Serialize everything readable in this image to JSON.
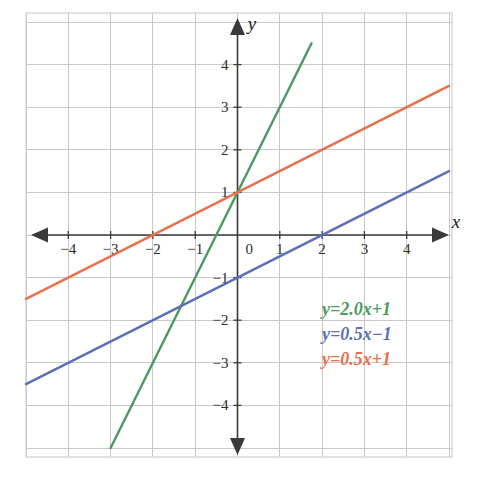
{
  "chart_data": {
    "type": "line",
    "title": "",
    "xlabel": "x",
    "ylabel": "y",
    "xlim": [
      -5,
      5
    ],
    "ylim": [
      -5,
      5
    ],
    "grid": true,
    "grid_step": 1,
    "legend_position": "inside-bottom-right",
    "x_tick_labels": [
      "-4",
      "-3",
      "-2",
      "-1",
      "0",
      "1",
      "2",
      "3",
      "4"
    ],
    "x_tick_values": [
      -4,
      -3,
      -2,
      -1,
      0,
      1,
      2,
      3,
      4
    ],
    "y_tick_labels": [
      "4",
      "3",
      "2",
      "1",
      "-1",
      "-2",
      "-3",
      "-4"
    ],
    "y_tick_values": [
      4,
      3,
      2,
      1,
      -1,
      -2,
      -3,
      -4
    ],
    "series": [
      {
        "name": "y=2.0x+1",
        "legend_label": "y=2.0x+1",
        "color": "#4a9a5e",
        "slope": 2.0,
        "intercept": 1,
        "x_start": -3.0,
        "x_end": 1.75,
        "y_start": -5.0,
        "y_end": 4.5,
        "x_intercept": -0.5,
        "y_intercept": 1
      },
      {
        "name": "y=0.5x-1",
        "legend_label": "y=0.5x−1",
        "color": "#5b6fb8",
        "slope": 0.5,
        "intercept": -1,
        "x_start": -5.0,
        "x_end": 5.0,
        "y_start": -3.5,
        "y_end": 1.5,
        "x_intercept": 2,
        "y_intercept": -1
      },
      {
        "name": "y=0.5x+1",
        "legend_label": "y=0.5x+1",
        "color": "#e8704a",
        "slope": 0.5,
        "intercept": 1,
        "x_start": -5.0,
        "x_end": 5.0,
        "y_start": -1.5,
        "y_end": 3.5,
        "x_intercept": -2,
        "y_intercept": 1
      }
    ],
    "annotations": []
  },
  "legend": {
    "items": [
      {
        "label": "y=2.0x+1",
        "color": "#4a9a5e"
      },
      {
        "label": "y=0.5x−1",
        "color": "#5b6fb8"
      },
      {
        "label": "y=0.5x+1",
        "color": "#e8704a"
      }
    ]
  },
  "axes": {
    "x_axis_label": "x",
    "y_axis_label": "y",
    "axis_color": "#3a3a3a",
    "grid_color": "#c9c9c9"
  },
  "ticks": {
    "x": [
      {
        "label": "-4",
        "value": -4
      },
      {
        "label": "-3",
        "value": -3
      },
      {
        "label": "-2",
        "value": -2
      },
      {
        "label": "-1",
        "value": -1
      },
      {
        "label": "0",
        "value": 0
      },
      {
        "label": "1",
        "value": 1
      },
      {
        "label": "2",
        "value": 2
      },
      {
        "label": "3",
        "value": 3
      },
      {
        "label": "4",
        "value": 4
      }
    ],
    "y": [
      {
        "label": "4",
        "value": 4
      },
      {
        "label": "3",
        "value": 3
      },
      {
        "label": "2",
        "value": 2
      },
      {
        "label": "1",
        "value": 1
      },
      {
        "label": "-1",
        "value": -1
      },
      {
        "label": "-2",
        "value": -2
      },
      {
        "label": "-3",
        "value": -3
      },
      {
        "label": "-4",
        "value": -4
      }
    ]
  }
}
